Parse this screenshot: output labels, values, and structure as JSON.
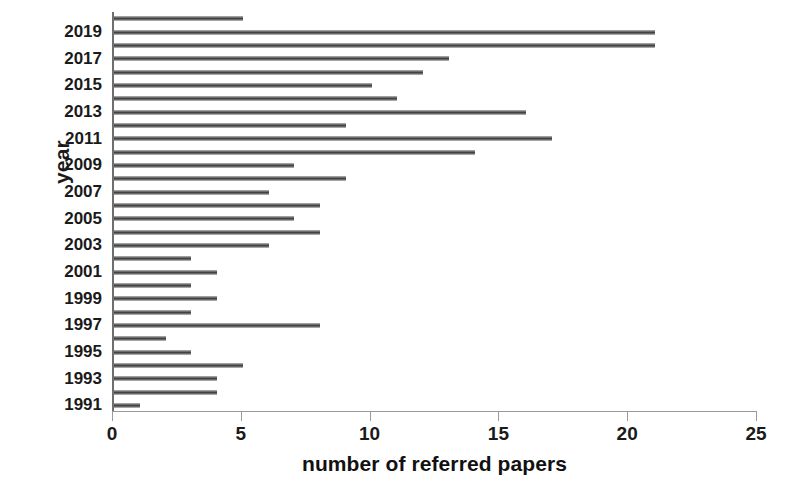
{
  "chart_data": {
    "type": "bar",
    "orientation": "horizontal",
    "title": "",
    "xlabel": "number of referred papers",
    "ylabel": "year",
    "xlim": [
      0,
      25
    ],
    "ylim_categories": [
      "1991",
      "2020"
    ],
    "grid": false,
    "legend": null,
    "xticks": [
      "0",
      "5",
      "10",
      "15",
      "20",
      "25"
    ],
    "xtick_values": [
      0,
      5,
      10,
      15,
      20,
      25
    ],
    "yticks": [
      "1991",
      "1993",
      "1995",
      "1997",
      "1999",
      "2001",
      "2003",
      "2005",
      "2007",
      "2009",
      "2011",
      "2013",
      "2015",
      "2017",
      "2019"
    ],
    "categories": [
      "1991",
      "1992",
      "1993",
      "1994",
      "1995",
      "1996",
      "1997",
      "1998",
      "1999",
      "2000",
      "2001",
      "2002",
      "2003",
      "2004",
      "2005",
      "2006",
      "2007",
      "2008",
      "2009",
      "2010",
      "2011",
      "2012",
      "2013",
      "2014",
      "2015",
      "2016",
      "2017",
      "2018",
      "2019",
      "2020"
    ],
    "values": [
      1,
      4,
      4,
      5,
      3,
      2,
      8,
      3,
      4,
      3,
      4,
      3,
      6,
      8,
      7,
      8,
      6,
      9,
      7,
      14,
      17,
      9,
      16,
      11,
      10,
      12,
      13,
      21,
      21,
      5
    ],
    "series": [
      {
        "name": "number of referred papers",
        "values": [
          1,
          4,
          4,
          5,
          3,
          2,
          8,
          3,
          4,
          3,
          4,
          3,
          6,
          8,
          7,
          8,
          6,
          9,
          7,
          14,
          17,
          9,
          16,
          11,
          10,
          12,
          13,
          21,
          21,
          5
        ]
      }
    ],
    "colors": {
      "bar": "#3f3f3f",
      "bar_highlight": "#c9c9c9",
      "axis": "#9a9a9a",
      "text": "#1a1a1a",
      "background": "#ffffff"
    }
  },
  "axes": {
    "y_title": "year",
    "x_title": "number of referred papers"
  }
}
